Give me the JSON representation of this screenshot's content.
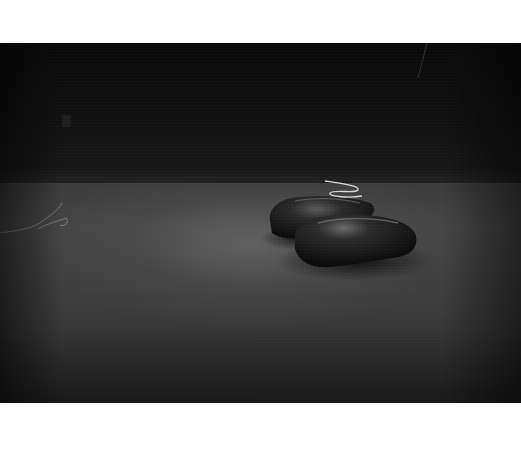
{
  "image": {
    "subject": "boxing gloves on carpet in dark room",
    "style": "black-and-white photograph",
    "alt": "Pair of boxing gloves lying on a carpeted floor in a dimly lit room"
  },
  "elements": [
    {
      "name": "boxing-glove-left",
      "description": "dark leather boxing glove"
    },
    {
      "name": "boxing-glove-right",
      "description": "dark leather boxing glove"
    },
    {
      "name": "glove-lace",
      "description": "white lace coil above gloves"
    },
    {
      "name": "floor-string",
      "description": "loose string on carpet at left"
    },
    {
      "name": "wall-outlet",
      "description": "faint wall outlet on left wall"
    }
  ],
  "colors": {
    "border": "#ffffff",
    "wall": "#0d0d0d",
    "floor_light": "#555555",
    "floor_dark": "#262626",
    "glove": "#1a1a1a",
    "glove_highlight": "#6a6a6a",
    "lace": "#d8d8d8"
  }
}
